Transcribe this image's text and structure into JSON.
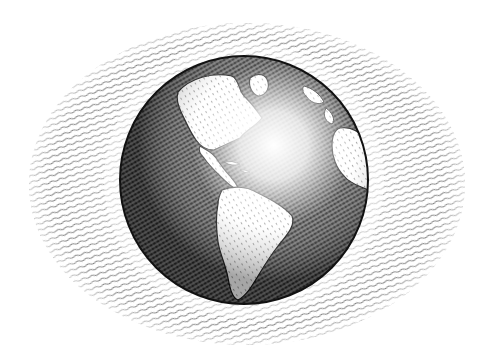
{
  "illustration": {
    "subject": "globe",
    "style": "pen-and-ink hatching",
    "view": "Western hemisphere (Americas, Atlantic, West Africa)",
    "background": "hatched oval",
    "colors": {
      "paper": "#ffffff",
      "ink": "#1a1a1a",
      "hatch": "#555555"
    },
    "globe": {
      "cx": 244,
      "cy": 180,
      "r": 124
    },
    "oval": {
      "cx": 247,
      "cy": 184,
      "rx": 218,
      "ry": 161
    },
    "highlight": {
      "cx": 282,
      "cy": 148,
      "r": 60
    }
  }
}
